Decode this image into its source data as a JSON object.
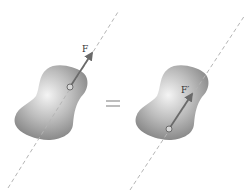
{
  "diagram": {
    "left": {
      "force_label": "F"
    },
    "equals_sign": "=",
    "right": {
      "force_label": "F′"
    },
    "colors": {
      "body_fill_light": "#f2f2f2",
      "body_fill_dark": "#8e8e8e",
      "line_of_action": "#b5b5b5",
      "arrow": "#6a6a6a",
      "equals": "#9a9a9a"
    }
  }
}
